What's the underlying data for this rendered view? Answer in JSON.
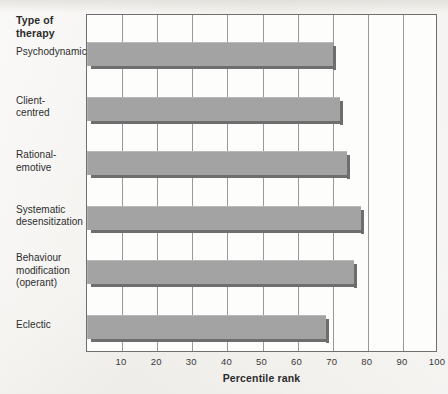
{
  "figure": {
    "axis_heading": "Type of\ntherapy",
    "heading_line1": "Type of",
    "heading_line2": "therapy"
  },
  "chart_data": {
    "type": "bar",
    "orientation": "horizontal",
    "title": "",
    "xlabel": "Percentile rank",
    "ylabel": "Type of therapy",
    "xlim": [
      0,
      100
    ],
    "xticks": [
      10,
      20,
      30,
      40,
      50,
      60,
      70,
      80,
      90,
      100
    ],
    "xtick_labels": [
      "10",
      "20",
      "30",
      "40",
      "50",
      "60",
      "70",
      "80",
      "90",
      "100"
    ],
    "grid": "vertical",
    "legend": "none",
    "bar_color": "#a3a3a3",
    "bar_shadow_color": "#6e6e6e",
    "plot_background": "#fdfdfc",
    "page_background": "#f3f2ef",
    "categories": [
      "Psychodynamic",
      "Client-centred",
      "Rational-emotive",
      "Systematic desensitization",
      "Behaviour modification (operant)",
      "Eclectic"
    ],
    "category_label_lines": [
      [
        "Psychodynamic"
      ],
      [
        "Client-",
        "centred"
      ],
      [
        "Rational-",
        "emotive"
      ],
      [
        "Systematic",
        "desensitization"
      ],
      [
        "Behaviour",
        "modification",
        "(operant)"
      ],
      [
        "Eclectic"
      ]
    ],
    "values": [
      70,
      72,
      74,
      78,
      76,
      68
    ]
  }
}
